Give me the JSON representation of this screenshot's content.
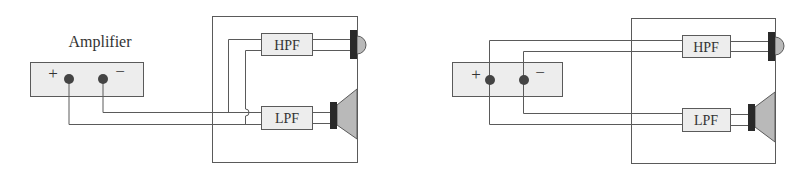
{
  "colors": {
    "line": "#5a5a5a",
    "box_fill": "#ededed",
    "terminal": "#444444",
    "driver_bar": "#2a2a2a",
    "driver_fill": "#b9b9b9",
    "text": "#333333"
  },
  "diagrams": [
    {
      "id": "single-wiring",
      "amplifier": {
        "label": "Amplifier",
        "plus": "+",
        "minus": "−"
      },
      "filters": {
        "high": "HPF",
        "low": "LPF"
      },
      "drivers": [
        "tweeter",
        "woofer"
      ]
    },
    {
      "id": "bi-wiring",
      "amplifier": {
        "label": "",
        "plus": "+",
        "minus": "−"
      },
      "filters": {
        "high": "HPF",
        "low": "LPF"
      },
      "drivers": [
        "tweeter",
        "woofer"
      ]
    }
  ]
}
